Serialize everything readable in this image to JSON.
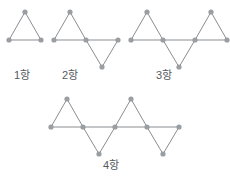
{
  "figure": {
    "title_clipped": "",
    "stroke_color": "#8a8d91",
    "node_color": "#9a9da1",
    "node_radius": 2.6,
    "stroke_width": 1.0,
    "label_color": "#555a5e",
    "background": "#ffffff"
  },
  "terms": [
    {
      "id": "term-1",
      "label": "1항",
      "triangle_count": 1,
      "label_x": 14,
      "label_y": 70,
      "baseline_y": 40,
      "apex_up_y": 12,
      "apex_down_y": 68,
      "start_x": 9,
      "step_x": 16.5,
      "directions": [
        "up"
      ],
      "points": [
        {
          "x": 9,
          "y": 40
        },
        {
          "x": 25,
          "y": 12
        },
        {
          "x": 41,
          "y": 40
        }
      ]
    },
    {
      "id": "term-2",
      "label": "2항",
      "triangle_count": 2,
      "label_x": 62,
      "label_y": 70,
      "baseline_y": 40,
      "apex_up_y": 12,
      "apex_down_y": 68,
      "start_x": 54,
      "step_x": 16.5,
      "directions": [
        "up",
        "down"
      ],
      "points": [
        {
          "x": 54,
          "y": 40
        },
        {
          "x": 70,
          "y": 12
        },
        {
          "x": 86,
          "y": 40
        },
        {
          "x": 102,
          "y": 67
        },
        {
          "x": 118,
          "y": 40
        }
      ]
    },
    {
      "id": "term-3",
      "label": "3항",
      "triangle_count": 3,
      "label_x": 156,
      "label_y": 70,
      "baseline_y": 40,
      "apex_up_y": 12,
      "apex_down_y": 68,
      "start_x": 131,
      "step_x": 16.5,
      "directions": [
        "up",
        "down",
        "up"
      ],
      "points": [
        {
          "x": 131,
          "y": 40
        },
        {
          "x": 147,
          "y": 12
        },
        {
          "x": 163,
          "y": 40
        },
        {
          "x": 179,
          "y": 67
        },
        {
          "x": 195,
          "y": 40
        },
        {
          "x": 211,
          "y": 12
        },
        {
          "x": 227,
          "y": 40
        }
      ]
    },
    {
      "id": "term-4",
      "label": "4항",
      "triangle_count": 4,
      "label_x": 103,
      "label_y": 160,
      "baseline_y": 127,
      "apex_up_y": 99,
      "apex_down_y": 155,
      "start_x": 51,
      "step_x": 16.5,
      "directions": [
        "up",
        "down",
        "up",
        "down"
      ],
      "points": [
        {
          "x": 51,
          "y": 127
        },
        {
          "x": 67,
          "y": 99
        },
        {
          "x": 83,
          "y": 127
        },
        {
          "x": 99,
          "y": 154
        },
        {
          "x": 115,
          "y": 127
        },
        {
          "x": 131,
          "y": 99
        },
        {
          "x": 147,
          "y": 127
        },
        {
          "x": 163,
          "y": 154
        },
        {
          "x": 179,
          "y": 127
        }
      ]
    }
  ],
  "baselines": [
    {
      "id": "baseline-1",
      "x1": 9,
      "x2": 41,
      "y": 40
    },
    {
      "id": "baseline-2",
      "x1": 54,
      "x2": 118,
      "y": 40
    },
    {
      "id": "baseline-3",
      "x1": 131,
      "x2": 227,
      "y": 40
    },
    {
      "id": "baseline-4",
      "x1": 51,
      "x2": 179,
      "y": 127
    }
  ]
}
